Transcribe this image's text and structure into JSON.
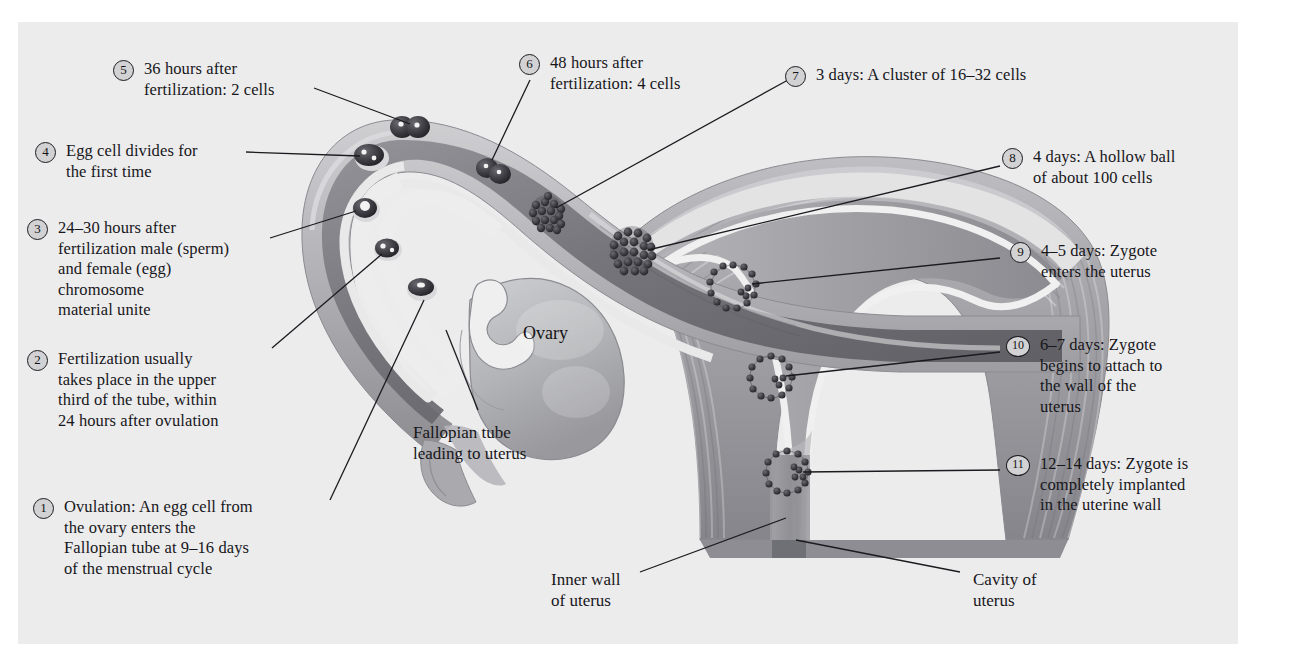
{
  "figure": {
    "background_color": "#ffffff",
    "panel_color": "#ececed"
  },
  "copyright": "Copyright © Cengage Learning 2010",
  "anatomy_labels": [
    {
      "name": "ovary",
      "text": "Ovary"
    },
    {
      "name": "fallopian-tube",
      "lines": [
        "Fallopian tube",
        "leading to uterus"
      ]
    },
    {
      "name": "inner-wall-of-uterus",
      "lines": [
        "Inner wall",
        "of uterus"
      ]
    },
    {
      "name": "cavity-of-uterus",
      "lines": [
        "Cavity of",
        "uterus"
      ]
    }
  ],
  "steps": [
    {
      "number": "1",
      "lines": [
        "Ovulation:  An egg cell from",
        "the ovary enters the",
        "Fallopian tube at 9–16 days",
        "of the menstrual cycle"
      ]
    },
    {
      "number": "2",
      "lines": [
        "Fertilization usually",
        "takes place in the upper",
        "third of the tube, within",
        "24 hours after ovulation"
      ]
    },
    {
      "number": "3",
      "lines": [
        "24–30 hours after",
        "fertilization male (sperm)",
        "and female (egg)",
        "chromosome",
        "material unite"
      ]
    },
    {
      "number": "4",
      "lines": [
        "Egg cell divides for",
        "the first time"
      ]
    },
    {
      "number": "5",
      "lines": [
        "36 hours after",
        "fertilization:  2 cells"
      ]
    },
    {
      "number": "6",
      "lines": [
        "48 hours after",
        "fertilization:  4 cells"
      ]
    },
    {
      "number": "7",
      "lines": [
        "3 days:  A cluster of 16–32 cells"
      ]
    },
    {
      "number": "8",
      "lines": [
        "4 days:  A hollow ball",
        "of about 100 cells"
      ]
    },
    {
      "number": "9",
      "lines": [
        "4–5 days:  Zygote",
        "enters the uterus"
      ]
    },
    {
      "number": "10",
      "lines": [
        "6–7 days:  Zygote",
        "begins to attach to",
        "the wall of the",
        "uterus"
      ]
    },
    {
      "number": "11",
      "lines": [
        "12–14 days:  Zygote is",
        "completely implanted",
        "in the uterine wall"
      ]
    }
  ],
  "colors": {
    "tissue_dark": "#6e6e73",
    "tissue_mid": "#9a9a9e",
    "tissue_light": "#c3c3c6",
    "lumen": "#e7e7e8",
    "outline": "#1b1a1e",
    "text": "#17161a",
    "marker_fill": "#d2d2d4"
  }
}
